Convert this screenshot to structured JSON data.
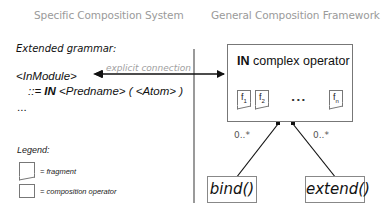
{
  "headings": {
    "left": "Specific Composition System",
    "right": "General Composition Framework"
  },
  "grammar": {
    "title": "Extended grammar:",
    "rule_lhs": "<InModule>",
    "rule_prefix": "::= ",
    "rule_keyword": "IN",
    "rule_rhs": " <Predname> ( <Atom> )",
    "ellipsis": "..."
  },
  "connection": {
    "label": "explicit connection"
  },
  "operator_box": {
    "keyword": "IN",
    "title": " complex operator",
    "fragments": [
      {
        "base": "f",
        "sub": "1"
      },
      {
        "base": "f",
        "sub": "2"
      },
      {
        "base": "f",
        "sub": "n"
      }
    ],
    "ellipsis": "..."
  },
  "associations": [
    {
      "multiplicity": "0..*",
      "target": "bind()"
    },
    {
      "multiplicity": "0..*",
      "target": "extend()"
    }
  ],
  "legend": {
    "title": "Legend:",
    "items": [
      {
        "shape": "fragment",
        "label": "= fragment"
      },
      {
        "shape": "composition-operator",
        "label": "= composition operator"
      }
    ]
  },
  "colors": {
    "heading": "#9a9a9a",
    "lines": "#111111",
    "box_border": "#777777"
  }
}
